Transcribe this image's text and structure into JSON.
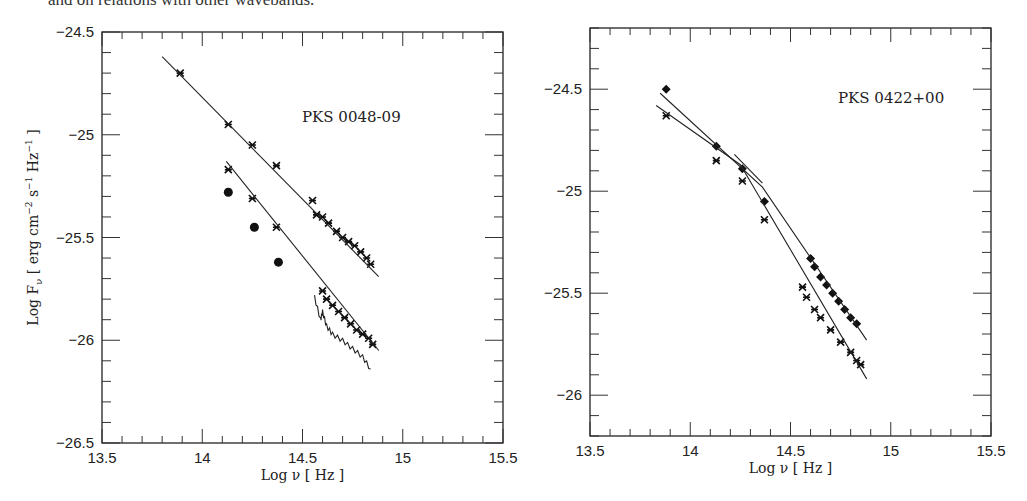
{
  "caption": "and on relations with other wavebands.",
  "chart_data": [
    {
      "type": "scatter",
      "title": "PKS 0048-09",
      "xlabel": "Log ν  [ Hz ]",
      "ylabel": "Log F_ν  [ erg cm^-2 s^-1 Hz^-1 ]",
      "xlim": [
        13.5,
        15.5
      ],
      "ylim": [
        -26.5,
        -24.5
      ],
      "xticks": [
        "13.5",
        "14",
        "14.5",
        "15",
        "15.5"
      ],
      "yticks": [
        "-24.5",
        "-25",
        "-25.5",
        "-26",
        "-26.5"
      ],
      "grid": false,
      "series": [
        {
          "name": "upper spectrum (stars)",
          "marker": "star",
          "x": [
            13.89,
            14.13,
            14.25,
            14.37,
            14.55,
            14.57,
            14.6,
            14.63,
            14.67,
            14.7,
            14.73,
            14.76,
            14.79,
            14.82,
            14.84
          ],
          "y": [
            -24.7,
            -24.95,
            -25.05,
            -25.15,
            -25.32,
            -25.39,
            -25.4,
            -25.43,
            -25.47,
            -25.5,
            -25.52,
            -25.54,
            -25.57,
            -25.6,
            -25.63
          ]
        },
        {
          "name": "upper power-law fit",
          "marker": "line",
          "x": [
            13.8,
            14.88
          ],
          "y": [
            -24.62,
            -25.69
          ]
        },
        {
          "name": "lower spectrum (stars)",
          "marker": "star",
          "x": [
            14.13,
            14.25,
            14.37,
            14.6,
            14.62,
            14.65,
            14.68,
            14.71,
            14.74,
            14.77,
            14.8,
            14.83,
            14.85
          ],
          "y": [
            -25.17,
            -25.31,
            -25.45,
            -25.76,
            -25.8,
            -25.83,
            -25.86,
            -25.89,
            -25.92,
            -25.95,
            -25.97,
            -25.99,
            -26.02
          ]
        },
        {
          "name": "lower power-law fit",
          "marker": "line",
          "x": [
            14.12,
            14.88
          ],
          "y": [
            -25.13,
            -26.05
          ]
        },
        {
          "name": "filled circles",
          "marker": "circle",
          "x": [
            14.13,
            14.26,
            14.38
          ],
          "y": [
            -25.28,
            -25.45,
            -25.62
          ]
        },
        {
          "name": "noisy spectrum",
          "marker": "jagged-line",
          "x": [
            14.56,
            14.59,
            14.6,
            14.62,
            14.65,
            14.7,
            14.75,
            14.8,
            14.84
          ],
          "y": [
            -25.79,
            -25.9,
            -25.86,
            -25.93,
            -25.97,
            -26.0,
            -26.04,
            -26.08,
            -26.14
          ]
        }
      ]
    },
    {
      "type": "scatter",
      "title": "PKS 0422+00",
      "xlabel": "Log ν  [ Hz ]",
      "ylabel": "",
      "xlim": [
        13.5,
        15.5
      ],
      "ylim": [
        -26.2,
        -24.2
      ],
      "xticks": [
        "13.5",
        "14",
        "14.5",
        "15",
        "15.5"
      ],
      "yticks": [
        "-24.5",
        "-25",
        "-25.5",
        "-26"
      ],
      "grid": false,
      "series": [
        {
          "name": "diamond spectrum",
          "marker": "diamond",
          "x": [
            13.88,
            14.13,
            14.26,
            14.37,
            14.6,
            14.62,
            14.65,
            14.68,
            14.71,
            14.74,
            14.77,
            14.8,
            14.83
          ],
          "y": [
            -24.5,
            -24.78,
            -24.89,
            -25.05,
            -25.33,
            -25.37,
            -25.42,
            -25.46,
            -25.5,
            -25.54,
            -25.58,
            -25.62,
            -25.65
          ]
        },
        {
          "name": "diamond fit",
          "marker": "line",
          "x": [
            13.85,
            14.36,
            14.88
          ],
          "y": [
            -24.52,
            -24.98,
            -25.73
          ]
        },
        {
          "name": "star spectrum",
          "marker": "star",
          "x": [
            13.88,
            14.13,
            14.26,
            14.37,
            14.56,
            14.58,
            14.62,
            14.65,
            14.7,
            14.75,
            14.8,
            14.83,
            14.85
          ],
          "y": [
            -24.63,
            -24.85,
            -24.95,
            -25.14,
            -25.47,
            -25.52,
            -25.58,
            -25.62,
            -25.68,
            -25.74,
            -25.79,
            -25.83,
            -25.85
          ]
        },
        {
          "name": "star fit",
          "marker": "line",
          "x": [
            13.83,
            14.25,
            14.88
          ],
          "y": [
            -24.58,
            -24.87,
            -25.92
          ]
        },
        {
          "name": "short segment",
          "marker": "line",
          "x": [
            14.22,
            14.36
          ],
          "y": [
            -24.82,
            -24.96
          ]
        }
      ]
    }
  ],
  "panels": [
    {
      "label": "PKS 0048-09"
    },
    {
      "label": "PKS 0422+00"
    }
  ],
  "axis": {
    "xlabel": "Log ν  [ Hz ]",
    "ylabel": "Log F_ν  [ erg cm^-2 s^-1 Hz^-1 ]",
    "left_yticks": [
      "-24.5",
      "-25",
      "-25.5",
      "-26",
      "-26.5"
    ],
    "right_yticks": [
      "-24.5",
      "-25",
      "-25.5",
      "-26"
    ],
    "xticks": [
      "13.5",
      "14",
      "14.5",
      "15",
      "15.5"
    ]
  }
}
